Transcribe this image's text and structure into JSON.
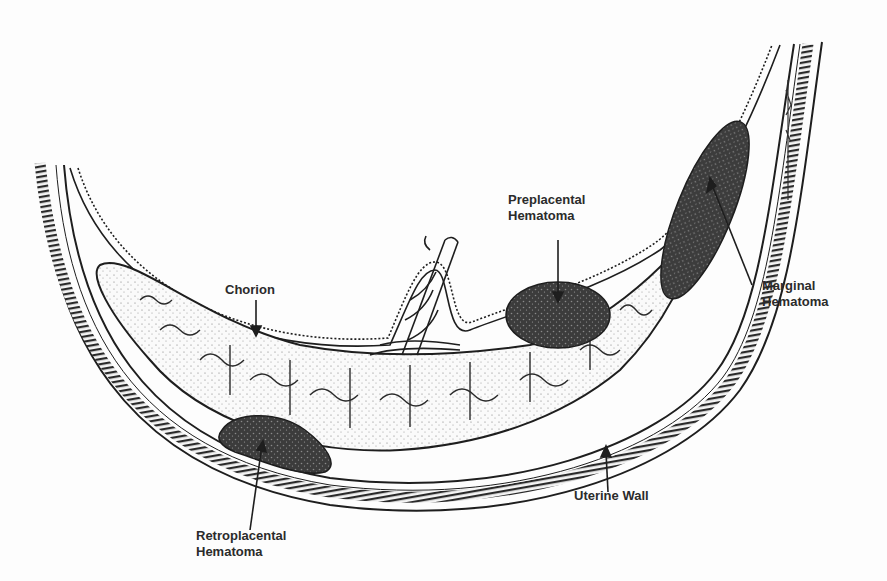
{
  "figure": {
    "colors": {
      "ink": "#1e1e1e",
      "hematoma": "#3a3a3a",
      "paper": "#fdfdfd"
    }
  },
  "labels": {
    "chorion": "Chorion",
    "preplacental": {
      "line1": "Preplacental",
      "line2": "Hematoma"
    },
    "marginal": {
      "line1": "Marginal",
      "line2": "Hematoma"
    },
    "retroplacental": {
      "line1": "Retroplacental",
      "line2": "Hematoma"
    },
    "uterine_wall": "Uterine Wall"
  }
}
